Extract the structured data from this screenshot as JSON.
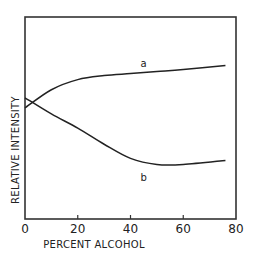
{
  "chart_data": {
    "type": "line",
    "title": "",
    "xlabel": "PERCENT ALCOHOL",
    "ylabel": "RELATIVE INTENSITY",
    "xlim": [
      0,
      80
    ],
    "ylim": [
      0,
      100
    ],
    "xticks": [
      0,
      20,
      40,
      60,
      80
    ],
    "xtick_labels": [
      "0",
      "20",
      "40",
      "60",
      "80"
    ],
    "yticks": [],
    "grid": false,
    "legend": "none (curves labeled directly)",
    "y_units_note": "arbitrary relative scale (no numeric y ticks shown)",
    "x": [
      0,
      10,
      20,
      30,
      40,
      50,
      60,
      76
    ],
    "series": [
      {
        "name": "a",
        "values": [
          55,
          64,
          69,
          71,
          72,
          73,
          74,
          76
        ],
        "label_position": [
          45,
          77
        ]
      },
      {
        "name": "b",
        "values": [
          60,
          52,
          45,
          37,
          30,
          27,
          27,
          29
        ],
        "label_position": [
          45,
          21
        ]
      }
    ]
  },
  "colors": {
    "line": "#222222",
    "frame": "#333333",
    "background": "#ffffff"
  }
}
